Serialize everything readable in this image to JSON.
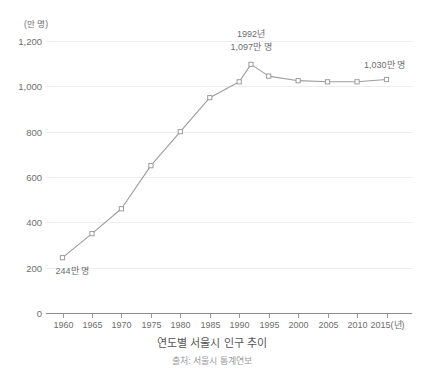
{
  "chart_data": {
    "type": "line",
    "title": "연도별 서울시 인구 추이",
    "source": "출처: 서울시 통계연보",
    "unit_label": "(만 명)",
    "xlabel": "",
    "xlabel_suffix": "(년)",
    "ylabel": "",
    "ylim": [
      0,
      1200
    ],
    "xlim": [
      1960,
      2015
    ],
    "grid": true,
    "legend": "none",
    "ytick_values": [
      0,
      200,
      400,
      600,
      800,
      1000,
      1200
    ],
    "ytick_labels": [
      "0",
      "200",
      "400",
      "600",
      "800",
      "1,000",
      "1,200"
    ],
    "xtick_values": [
      1960,
      1965,
      1970,
      1975,
      1980,
      1985,
      1990,
      1995,
      2000,
      2005,
      2010,
      2015
    ],
    "xtick_labels": [
      "1960",
      "1965",
      "1970",
      "1975",
      "1980",
      "1985",
      "1990",
      "1995",
      "2000",
      "2005",
      "2010",
      "2015(년)"
    ],
    "x": [
      1960,
      1965,
      1970,
      1975,
      1980,
      1985,
      1990,
      1992,
      1995,
      2000,
      2005,
      2010,
      2015
    ],
    "values": [
      244,
      350,
      460,
      650,
      800,
      950,
      1020,
      1097,
      1045,
      1025,
      1020,
      1020,
      1030
    ],
    "series": [
      {
        "name": "서울시 인구",
        "values": [
          244,
          350,
          460,
          650,
          800,
          950,
          1020,
          1097,
          1045,
          1025,
          1020,
          1020,
          1030
        ]
      }
    ],
    "annotations": [
      {
        "name": "start-label",
        "text": "244만 명",
        "x": 1960,
        "y": 244
      },
      {
        "name": "peak-year-label",
        "text": "1992년",
        "x": 1992,
        "y": 1097
      },
      {
        "name": "peak-value-label",
        "text": "1,097만 명",
        "x": 1992,
        "y": 1097
      },
      {
        "name": "end-label",
        "text": "1,030만 명",
        "x": 2015,
        "y": 1030
      }
    ],
    "colors": {
      "line": "#9d9d9d",
      "marker_fill": "#ffffff",
      "marker_stroke": "#9d9d9d",
      "grid": "#ededed",
      "axis": "#8c8c8c",
      "text": "#6e6e6e",
      "title": "#555555",
      "source": "#9b9b9b",
      "background": "#ffffff"
    }
  }
}
